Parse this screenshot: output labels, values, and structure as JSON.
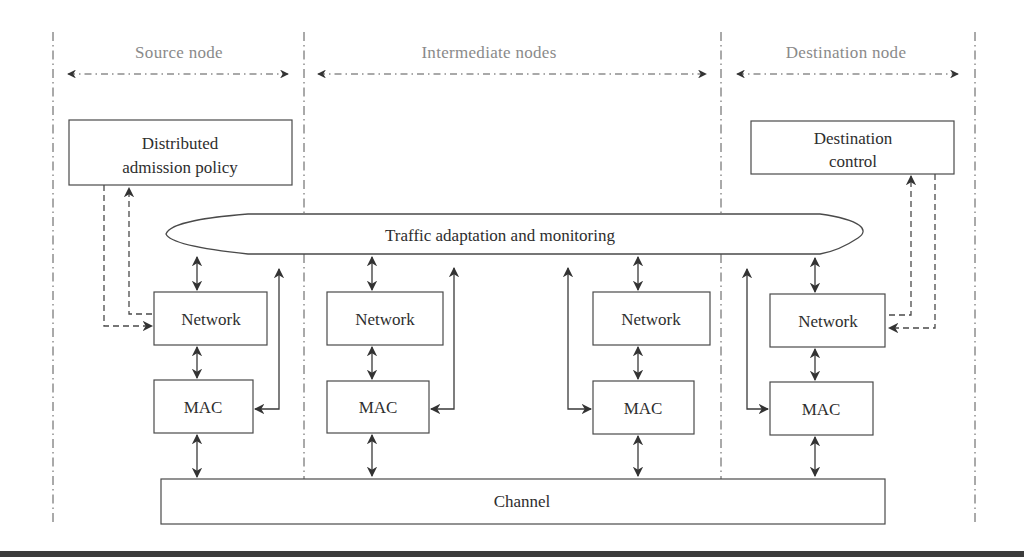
{
  "figure": {
    "sections": [
      {
        "id": "source",
        "label": "Source node"
      },
      {
        "id": "intermediate",
        "label": "Intermediate nodes"
      },
      {
        "id": "destination",
        "label": "Destination node"
      }
    ],
    "blocks": {
      "admission_policy": {
        "line1": "Distributed",
        "line2": "admission policy"
      },
      "destination_control": {
        "line1": "Destination",
        "line2": "control"
      },
      "traffic": "Traffic adaptation and monitoring",
      "channel": "Channel"
    },
    "nodes": [
      {
        "id": "source",
        "network": "Network",
        "mac": "MAC"
      },
      {
        "id": "intermediate-1",
        "network": "Network",
        "mac": "MAC"
      },
      {
        "id": "intermediate-2",
        "network": "Network",
        "mac": "MAC"
      },
      {
        "id": "destination",
        "network": "Network",
        "mac": "MAC"
      }
    ]
  },
  "colors": {
    "stroke": "#4a4a4a",
    "text": "#2e2e2e",
    "header_text": "#8a8a8a",
    "bottom_rule": "#3c3c3c"
  }
}
